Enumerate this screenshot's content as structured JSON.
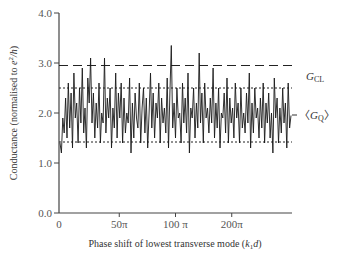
{
  "chart_data": {
    "type": "line",
    "title": "",
    "xlabel": "Phase shift of lowest transverse mode (k₁d)",
    "xlabel_parts": {
      "main": "Phase shift of lowest transverse mode (",
      "var_k": "k",
      "sub": "1",
      "var_d": "d",
      "close": ")"
    },
    "ylabel": "Conductance (normalised to e²/h)",
    "ylabel_parts": {
      "main": "Conductance (normalised to ",
      "e": "e",
      "sup": "2",
      "h": "/h",
      "close": ")"
    },
    "ylim": [
      0.0,
      4.0
    ],
    "xlim": [
      0,
      290
    ],
    "y_ticks": [
      {
        "value": 0.0,
        "label": "0.0"
      },
      {
        "value": 1.0,
        "label": "1.0"
      },
      {
        "value": 2.0,
        "label": "2.0"
      },
      {
        "value": 3.0,
        "label": "3.0"
      },
      {
        "value": 4.0,
        "label": "4.0"
      }
    ],
    "x_ticks": [
      {
        "value": 0,
        "label": "0"
      },
      {
        "value": 75,
        "label": "50π"
      },
      {
        "value": 145,
        "label": "100 π"
      },
      {
        "value": 215,
        "label": "200π"
      }
    ],
    "reference_lines": [
      {
        "name": "G_CL",
        "value": 2.95,
        "style": "dashed",
        "label": "G",
        "label_sub": "CL"
      },
      {
        "name": "upper-fluctuation-bound",
        "value": 2.5,
        "style": "dotted"
      },
      {
        "name": "lower-fluctuation-bound",
        "value": 1.42,
        "style": "dotted"
      }
    ],
    "annotations": [
      {
        "name": "mean-GQ",
        "value": 1.96,
        "label_open": "〈G",
        "label_sub": "Q",
        "label_close": "〉"
      }
    ],
    "grid": false,
    "series": [
      {
        "name": "conductance",
        "mean": 1.96,
        "values": [
          1.4,
          1.2,
          1.9,
          1.6,
          2.3,
          1.5,
          2.6,
          1.7,
          2.4,
          1.3,
          2.8,
          1.9,
          2.2,
          1.4,
          2.5,
          1.8,
          2.9,
          1.6,
          2.1,
          1.3,
          2.7,
          2.2,
          3.1,
          1.8,
          2.4,
          1.5,
          2.2,
          1.7,
          2.6,
          1.4,
          2.0,
          1.8,
          3.1,
          1.6,
          2.3,
          1.9,
          2.5,
          1.3,
          2.1,
          1.7,
          2.8,
          1.5,
          2.4,
          1.9,
          2.6,
          1.4,
          2.3,
          1.6,
          2.0,
          1.8,
          2.7,
          1.2,
          2.2,
          1.5,
          2.4,
          1.9,
          1.7,
          2.6,
          1.4,
          2.1,
          2.5,
          1.6,
          2.3,
          1.3,
          2.0,
          2.8,
          1.7,
          2.4,
          1.5,
          2.2,
          1.9,
          2.6,
          1.4,
          2.3,
          1.8,
          2.1,
          1.6,
          2.7,
          1.3,
          2.4,
          3.35,
          1.7,
          2.2,
          1.5,
          2.5,
          1.9,
          2.0,
          1.4,
          2.6,
          1.8,
          2.3,
          1.6,
          2.8,
          1.2,
          2.1,
          1.9,
          2.5,
          1.5,
          2.2,
          1.7,
          3.2,
          1.8,
          2.4,
          1.4,
          2.6,
          1.9,
          2.1,
          1.6,
          2.3,
          1.8,
          2.9,
          1.5,
          2.2,
          1.7,
          2.5,
          1.3,
          2.0,
          1.9,
          2.4,
          1.6,
          2.7,
          1.4,
          2.3,
          1.8,
          2.1,
          1.5,
          2.6,
          1.9,
          2.2,
          1.4,
          2.5,
          1.7,
          2.0,
          1.6,
          2.4,
          1.8,
          2.8,
          1.3,
          2.2,
          1.6,
          2.5,
          1.9,
          2.1,
          1.5,
          2.3,
          1.7,
          2.6,
          1.4,
          2.2,
          1.8,
          2.4,
          1.5,
          2.0,
          1.2,
          2.7,
          1.9,
          2.3,
          1.4,
          2.1,
          1.6,
          2.5,
          1.8,
          2.2,
          1.3,
          2.6,
          1.7,
          1.95
        ]
      }
    ]
  }
}
